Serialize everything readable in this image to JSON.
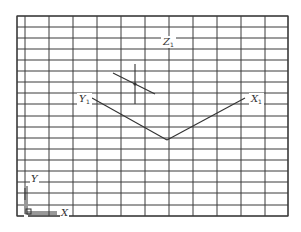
{
  "diagram": {
    "background": "#ffffff",
    "line_color": "#3a3a3a",
    "grid": {
      "left": 17,
      "right": 288,
      "top": 16,
      "bottom": 216,
      "vertical_x": [
        17,
        25,
        49,
        73,
        97,
        121,
        145,
        169,
        193,
        217,
        241,
        265,
        288
      ],
      "horizontal_y": [
        16,
        27,
        38,
        49,
        60,
        71,
        82,
        93,
        104,
        116,
        127,
        138,
        149,
        160,
        171,
        182,
        193,
        205,
        216
      ]
    },
    "axes": {
      "y1": {
        "label": "Y",
        "subscript": "1",
        "from": [
          92,
          98
        ],
        "to": [
          167,
          140
        ],
        "label_pos": [
          79,
          102
        ]
      },
      "x1": {
        "label": "X",
        "subscript": "1",
        "from": [
          167,
          140
        ],
        "to": [
          245,
          98
        ],
        "label_pos": [
          251,
          102
        ]
      },
      "z1": {
        "label": "Z",
        "subscript": "1",
        "label_pos": [
          163,
          45
        ]
      }
    },
    "marker": {
      "diagonal": {
        "from": [
          113,
          73
        ],
        "to": [
          155,
          94
        ]
      },
      "vertical": {
        "x": 135,
        "y1": 64,
        "y2": 104
      },
      "point": [
        135,
        84
      ]
    },
    "ucs_icon": {
      "y_label": "Y",
      "x_label": "X",
      "origin": [
        27,
        214
      ],
      "y_end": 186,
      "x_end": 57
    }
  }
}
